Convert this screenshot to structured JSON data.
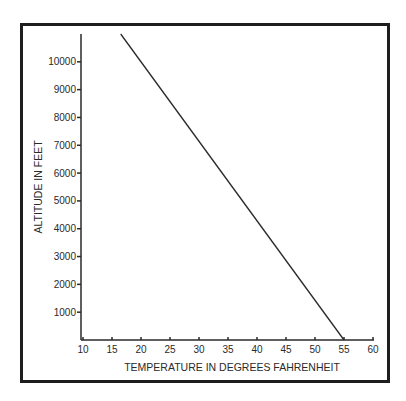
{
  "chart_data": {
    "type": "line",
    "title": "",
    "xlabel": "TEMPERATURE IN DEGREES FAHRENHEIT",
    "ylabel": "ALTITUDE IN FEET",
    "xlim": [
      10,
      60
    ],
    "ylim": [
      0,
      11000
    ],
    "x_ticks": [
      10,
      15,
      20,
      25,
      30,
      35,
      40,
      45,
      50,
      55,
      60
    ],
    "y_ticks": [
      1000,
      2000,
      3000,
      4000,
      5000,
      6000,
      7000,
      8000,
      9000,
      10000
    ],
    "grid": false,
    "legend": null,
    "series": [
      {
        "name": "Temperature vs altitude",
        "x": [
          16.5,
          55
        ],
        "y": [
          11000,
          0
        ]
      }
    ]
  }
}
